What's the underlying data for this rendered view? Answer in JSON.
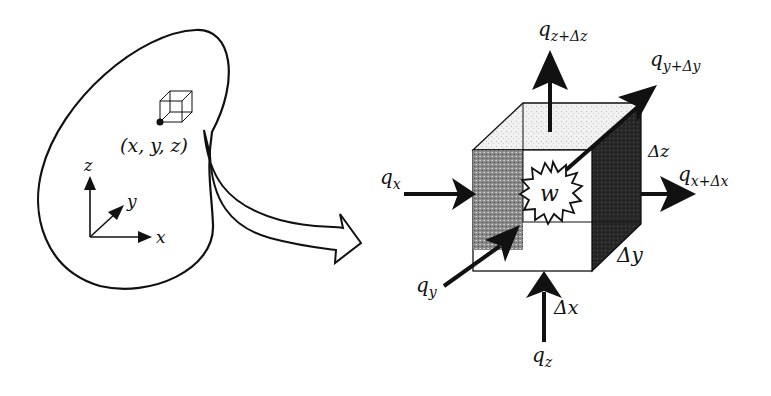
{
  "diagram": {
    "body": {
      "point_label": "(x, y, z)",
      "axes": {
        "x": "x",
        "y": "y",
        "z": "z"
      }
    },
    "element": {
      "generation_label": "w",
      "dimensions": {
        "dx": "Δx",
        "dy": "Δy",
        "dz": "Δz"
      },
      "fluxes": {
        "qx": {
          "base": "q",
          "sub": "x"
        },
        "qxdx": {
          "base": "q",
          "sub": "x+Δx"
        },
        "qy": {
          "base": "q",
          "sub": "y"
        },
        "qydy": {
          "base": "q",
          "sub": "y+Δy"
        },
        "qz": {
          "base": "q",
          "sub": "z"
        },
        "qzdz": {
          "base": "q",
          "sub": "z+Δz"
        }
      }
    },
    "colors": {
      "line": "#111111",
      "left_face": "#7a7a7a",
      "right_face": "#2a2a2a",
      "top_face": "#e6e6e6"
    }
  }
}
